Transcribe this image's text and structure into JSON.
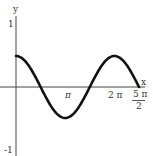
{
  "chart_data": {
    "type": "line",
    "title": "",
    "function": "y = 0.5 cos(x)",
    "xlabel": "x",
    "ylabel": "y",
    "xlim": [
      0,
      7.854
    ],
    "ylim": [
      -1,
      1
    ],
    "x_ticks": [
      "π",
      "2 π",
      "5π/2"
    ],
    "y_ticks": [
      "1",
      "-1"
    ],
    "series": [
      {
        "name": "0.5 cos x",
        "x": [
          0,
          0.785,
          1.571,
          2.356,
          3.1416,
          3.927,
          4.712,
          5.498,
          6.283,
          7.069,
          7.854
        ],
        "values": [
          0.5,
          0.354,
          0,
          -0.354,
          -0.5,
          -0.354,
          0,
          0.354,
          0.5,
          0.354,
          0
        ]
      }
    ],
    "grid": false
  },
  "labels": {
    "y_axis": "y",
    "x_axis": "x",
    "y_one": "1",
    "y_neg_one": "-1",
    "x_pi": "π",
    "x_two_pi": "2 π",
    "x_five_pi_num": "5 π",
    "x_five_pi_den": "2"
  }
}
